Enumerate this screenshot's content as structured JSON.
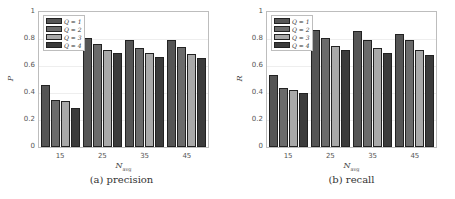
{
  "chart_data": [
    {
      "type": "bar",
      "title": "",
      "caption": "(a) precision",
      "xlabel": "N_avg",
      "ylabel": "P",
      "ylim": [
        0,
        1
      ],
      "yticks": [
        "0",
        "0.2",
        "0.4",
        "0.6",
        "0.8",
        "1"
      ],
      "categories": [
        "15",
        "25",
        "35",
        "45"
      ],
      "grid": true,
      "legend_position": "upper-left",
      "series": [
        {
          "name": "Q = 1",
          "color": "#555555",
          "values": [
            0.46,
            0.81,
            0.79,
            0.79
          ]
        },
        {
          "name": "Q = 2",
          "color": "#6b6b6b",
          "values": [
            0.35,
            0.76,
            0.73,
            0.74
          ]
        },
        {
          "name": "Q = 3",
          "color": "#a9a9a9",
          "values": [
            0.34,
            0.72,
            0.7,
            0.69
          ]
        },
        {
          "name": "Q = 4",
          "color": "#3b3b3b",
          "values": [
            0.29,
            0.7,
            0.67,
            0.66
          ]
        }
      ]
    },
    {
      "type": "bar",
      "title": "",
      "caption": "(b) recall",
      "xlabel": "N_avg",
      "ylabel": "R",
      "ylim": [
        0,
        1
      ],
      "yticks": [
        "0",
        "0.2",
        "0.4",
        "0.6",
        "0.8",
        "1"
      ],
      "categories": [
        "15",
        "25",
        "35",
        "45"
      ],
      "grid": true,
      "legend_position": "upper-left",
      "series": [
        {
          "name": "Q = 1",
          "color": "#555555",
          "values": [
            0.53,
            0.87,
            0.86,
            0.84
          ]
        },
        {
          "name": "Q = 2",
          "color": "#6b6b6b",
          "values": [
            0.44,
            0.81,
            0.79,
            0.79
          ]
        },
        {
          "name": "Q = 3",
          "color": "#a9a9a9",
          "values": [
            0.42,
            0.75,
            0.73,
            0.72
          ]
        },
        {
          "name": "Q = 4",
          "color": "#3b3b3b",
          "values": [
            0.4,
            0.72,
            0.7,
            0.68
          ]
        }
      ]
    }
  ],
  "panels": [
    {
      "caption": "(a) precision",
      "ylabel": "P",
      "xlabel_main": "N",
      "xlabel_sub": "avg"
    },
    {
      "caption": "(b) recall",
      "ylabel": "R",
      "xlabel_main": "N",
      "xlabel_sub": "avg"
    }
  ]
}
